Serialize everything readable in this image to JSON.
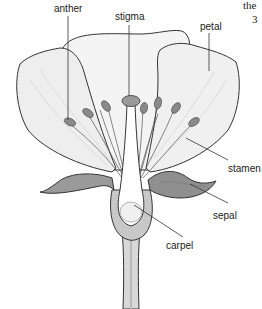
{
  "diagram": {
    "labels": {
      "anther": "anther",
      "stigma": "stigma",
      "petal": "petal",
      "stamen": "stamen",
      "sepal": "sepal",
      "carpel": "carpel"
    },
    "page_fragment": {
      "line1": "the",
      "line2": "3"
    }
  },
  "colors": {
    "outline": "#333333",
    "petal_fill": "#f4f4f4",
    "petal_shade": "#e4e4e4",
    "sepal_fill": "#9a9a9a",
    "sepal_dark": "#7a7a7a",
    "stem_fill": "#d8d8d8",
    "anther_fill": "#8a8a8a",
    "carpel_fill": "#ffffff"
  }
}
